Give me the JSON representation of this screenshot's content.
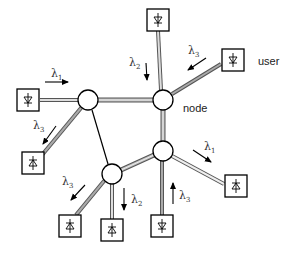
{
  "diagram": {
    "type": "optical network topology",
    "labels": {
      "user": "user",
      "node": "node"
    },
    "symbol": "λ",
    "colors": {
      "line": "#000000",
      "fiber_fill": "#bdbdbd",
      "box": "#000000",
      "background": "#ffffff"
    },
    "nodes": [
      {
        "id": "node-a",
        "x": 88,
        "y": 100
      },
      {
        "id": "node-b",
        "x": 163,
        "y": 100
      },
      {
        "id": "node-c",
        "x": 163,
        "y": 151
      },
      {
        "id": "node-d",
        "x": 112,
        "y": 174
      }
    ],
    "users": [
      {
        "id": "user-top",
        "x": 158,
        "y": 20,
        "diode": "down",
        "attached_to": "node-b"
      },
      {
        "id": "user-right",
        "x": 233,
        "y": 60,
        "diode": "down",
        "attached_to": "node-b"
      },
      {
        "id": "user-left",
        "x": 28,
        "y": 100,
        "diode": "down",
        "attached_to": "node-a"
      },
      {
        "id": "user-left-bottom",
        "x": 33,
        "y": 163,
        "diode": "up",
        "attached_to": "node-a"
      },
      {
        "id": "user-bottom-right",
        "x": 236,
        "y": 186,
        "diode": "up",
        "attached_to": "node-c"
      },
      {
        "id": "user-bottom-mid",
        "x": 162,
        "y": 226,
        "diode": "down",
        "attached_to": "node-c"
      },
      {
        "id": "user-bottom-left",
        "x": 72,
        "y": 226,
        "diode": "up",
        "attached_to": "node-d"
      },
      {
        "id": "user-bottom",
        "x": 112,
        "y": 230,
        "diode": "up",
        "attached_to": "node-d"
      }
    ],
    "links": [
      {
        "from": "node-a",
        "to": "node-b",
        "style": "fiber"
      },
      {
        "from": "node-b",
        "to": "node-c",
        "style": "fiber"
      },
      {
        "from": "node-c",
        "to": "node-d",
        "style": "fiber"
      },
      {
        "from": "node-a",
        "to": "node-d",
        "style": "thin"
      }
    ],
    "wavelengths": [
      {
        "name": "λ1",
        "base": "λ",
        "sub": "1",
        "x": 45,
        "y": 75,
        "arrow": "right"
      },
      {
        "name": "λ2",
        "base": "λ",
        "sub": "2",
        "x": 130,
        "y": 63,
        "arrow": "down"
      },
      {
        "name": "λ3",
        "base": "λ",
        "sub": "3",
        "x": 188,
        "y": 52,
        "arrow": "down-left"
      },
      {
        "name": "λ3",
        "base": "λ",
        "sub": "3",
        "x": 30,
        "y": 128,
        "arrow": "down-left"
      },
      {
        "name": "λ1",
        "base": "λ",
        "sub": "1",
        "x": 205,
        "y": 148,
        "arrow": "down-right"
      },
      {
        "name": "λ3",
        "base": "λ",
        "sub": "3",
        "x": 62,
        "y": 184,
        "arrow": "down-left"
      },
      {
        "name": "λ2",
        "base": "λ",
        "sub": "2",
        "x": 132,
        "y": 203,
        "arrow": "down"
      },
      {
        "name": "λ3",
        "base": "λ",
        "sub": "3",
        "x": 187,
        "y": 198,
        "arrow": "up"
      }
    ]
  }
}
